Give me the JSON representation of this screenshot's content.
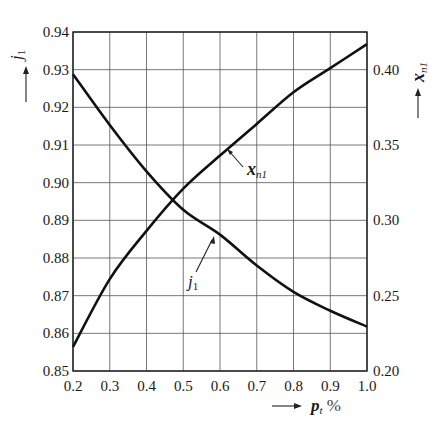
{
  "chart_data": {
    "type": "line",
    "title": "",
    "xlabel": "p_t %",
    "xlabel_parts": {
      "main": "p",
      "sub": "t",
      "suffix": " %"
    },
    "ylabel_left": "j1",
    "ylabel_left_parts": {
      "main": "j",
      "sub": "1"
    },
    "ylabel_right": "x_n1",
    "ylabel_right_parts": {
      "main": "x",
      "sub": "n1"
    },
    "xlim": [
      0.2,
      1.0
    ],
    "ylim_left": [
      0.85,
      0.94
    ],
    "ylim_right": [
      0.2,
      0.425
    ],
    "grid": true,
    "x_ticks": [
      "0.2",
      "0.3",
      "0.4",
      "0.5",
      "0.6",
      "0.7",
      "0.8",
      "0.9",
      "1.0"
    ],
    "y_left_ticks": [
      "0.85",
      "0.86",
      "0.87",
      "0.88",
      "0.89",
      "0.90",
      "0.91",
      "0.92",
      "0.93",
      "0.94"
    ],
    "y_right_ticks": [
      "0.20",
      "0.25",
      "0.30",
      "0.35",
      "0.40"
    ],
    "series": [
      {
        "name": "j1",
        "label": {
          "main": "j",
          "sub": "1"
        },
        "axis": "left",
        "x": [
          0.2,
          0.3,
          0.4,
          0.5,
          0.6,
          0.7,
          0.8,
          0.9,
          1.0
        ],
        "y": [
          0.9288,
          0.9153,
          0.903,
          0.8928,
          0.8862,
          0.878,
          0.871,
          0.866,
          0.8618
        ]
      },
      {
        "name": "x_n1",
        "label": {
          "main": "x",
          "sub": "n1"
        },
        "axis": "right",
        "x": [
          0.2,
          0.3,
          0.4,
          0.5,
          0.6,
          0.7,
          0.8,
          0.9,
          1.0
        ],
        "y": [
          0.216,
          0.261,
          0.293,
          0.321,
          0.343,
          0.364,
          0.385,
          0.401,
          0.417
        ]
      }
    ]
  }
}
